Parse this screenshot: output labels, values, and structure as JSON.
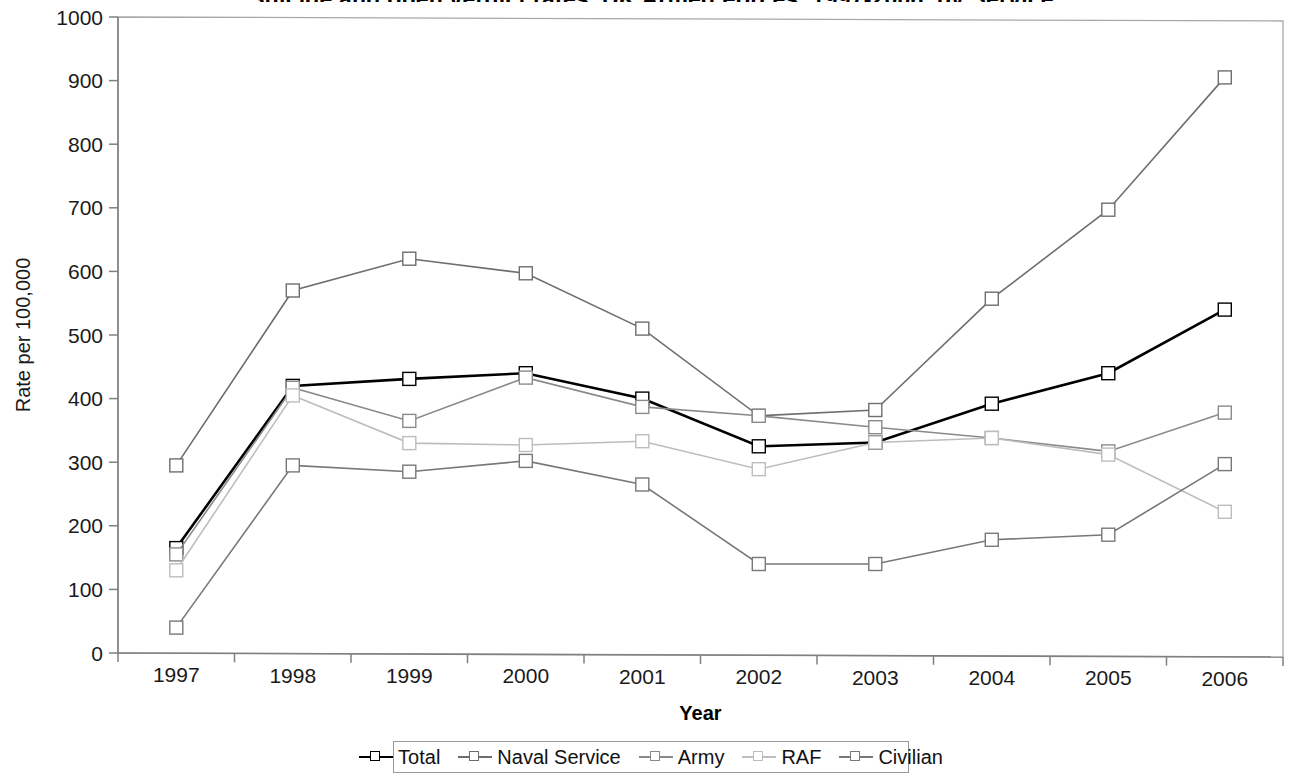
{
  "chart_title": "Suicide and open verdict rates, UK Armed Forces, 1997-2006, by Service",
  "axis": {
    "x_label": "Year",
    "y_label": "Rate per 100,000"
  },
  "legend": {
    "position": "bottom",
    "items": [
      {
        "label": "Total",
        "color": "#000000"
      },
      {
        "label": "Naval Service",
        "color": "#6e6e6e"
      },
      {
        "label": "Army",
        "color": "#8a8a8a"
      },
      {
        "label": "RAF",
        "color": "#bdbdbd"
      },
      {
        "label": "Civilian",
        "color": "#787878"
      }
    ]
  },
  "chart_data": {
    "type": "line",
    "title": "Suicide and open verdict rates, UK Armed Forces, 1997-2006, by Service",
    "xlabel": "Year",
    "ylabel": "Rate per 100,000",
    "categories": [
      "1997",
      "1998",
      "1999",
      "2000",
      "2001",
      "2002",
      "2003",
      "2004",
      "2005",
      "2006"
    ],
    "ylim": [
      0,
      1000
    ],
    "ytick_step": 100,
    "yticks": [
      0,
      100,
      200,
      300,
      400,
      500,
      600,
      700,
      800,
      900,
      1000
    ],
    "grid": false,
    "legend_position": "bottom",
    "marker": "open-square",
    "series": [
      {
        "name": "Total",
        "color": "#000000",
        "width": 2.6,
        "values": [
          165,
          420,
          431,
          440,
          400,
          325,
          331,
          392,
          440,
          540
        ]
      },
      {
        "name": "Naval Service",
        "color": "#6e6e6e",
        "width": 1.6,
        "values": [
          295,
          570,
          620,
          597,
          510,
          373,
          382,
          557,
          697,
          905
        ]
      },
      {
        "name": "Army",
        "color": "#8a8a8a",
        "width": 1.6,
        "values": [
          155,
          417,
          365,
          433,
          387,
          373,
          355,
          338,
          317,
          378
        ]
      },
      {
        "name": "RAF",
        "color": "#bdbdbd",
        "width": 1.6,
        "values": [
          130,
          405,
          330,
          327,
          333,
          289,
          331,
          338,
          312,
          222
        ]
      },
      {
        "name": "Civilian",
        "color": "#787878",
        "width": 1.6,
        "values": [
          40,
          295,
          285,
          302,
          265,
          140,
          140,
          178,
          186,
          297
        ]
      }
    ]
  }
}
